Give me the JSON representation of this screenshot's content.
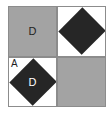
{
  "figure": {
    "type": "quadrant-tile-diagram",
    "background_color": "#ffffff",
    "border_color": "#8c8c8c",
    "gray_color": "#a3a3a3",
    "dark_color": "#262626",
    "white_color": "#ffffff",
    "cells": [
      {
        "position": "top-left",
        "fill": "gray",
        "shape": "none",
        "center_label": "D",
        "corner_label": ""
      },
      {
        "position": "top-right",
        "fill": "white",
        "shape": "diamond",
        "shape_fill": "dark",
        "center_label": "",
        "corner_label": ""
      },
      {
        "position": "bottom-left",
        "fill": "white",
        "shape": "diamond",
        "shape_fill": "dark",
        "center_label": "D",
        "corner_label": "A"
      },
      {
        "position": "bottom-right",
        "fill": "gray",
        "shape": "none",
        "center_label": "",
        "corner_label": ""
      }
    ]
  }
}
